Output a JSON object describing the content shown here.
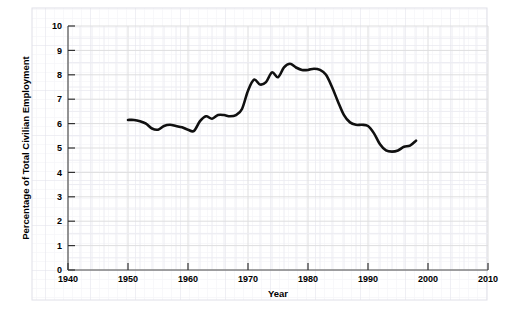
{
  "chart_data": {
    "type": "line",
    "title": "",
    "xlabel": "Year",
    "ylabel": "Percentage of Total Civilian Employment",
    "xlim": [
      1940,
      2010
    ],
    "ylim": [
      0,
      10
    ],
    "xticks": [
      1940,
      1950,
      1960,
      1970,
      1980,
      1990,
      2000,
      2010
    ],
    "xticklabels": [
      "1940",
      "1950",
      "1960",
      "1970",
      "1980",
      "1990",
      "2000",
      "2010"
    ],
    "yticks": [
      0,
      1,
      2,
      3,
      4,
      5,
      6,
      7,
      8,
      9,
      10
    ],
    "yticklabels": [
      "0",
      "1",
      "2",
      "3",
      "4",
      "5",
      "6",
      "7",
      "8",
      "9",
      "10"
    ],
    "grid": true,
    "grid_color": "#e8e8ee",
    "line_color": "#101010",
    "line_width": 2.6,
    "legend": null,
    "series": [
      {
        "name": "Percentage of Total Civilian Employment",
        "x": [
          1950,
          1951,
          1952,
          1953,
          1954,
          1955,
          1956,
          1957,
          1958,
          1959,
          1960,
          1961,
          1962,
          1963,
          1964,
          1965,
          1966,
          1967,
          1968,
          1969,
          1970,
          1971,
          1972,
          1973,
          1974,
          1975,
          1976,
          1977,
          1978,
          1979,
          1980,
          1981,
          1982,
          1983,
          1984,
          1985,
          1986,
          1987,
          1988,
          1989,
          1990,
          1991,
          1992,
          1993,
          1994,
          1995,
          1996,
          1997,
          1998
        ],
        "y": [
          6.15,
          6.15,
          6.1,
          6.0,
          5.8,
          5.75,
          5.9,
          5.95,
          5.9,
          5.85,
          5.75,
          5.7,
          6.1,
          6.3,
          6.2,
          6.35,
          6.35,
          6.3,
          6.35,
          6.6,
          7.35,
          7.8,
          7.6,
          7.7,
          8.1,
          7.9,
          8.3,
          8.45,
          8.3,
          8.2,
          8.2,
          8.25,
          8.2,
          8.0,
          7.5,
          6.9,
          6.35,
          6.05,
          5.95,
          5.95,
          5.9,
          5.6,
          5.15,
          4.9,
          4.85,
          4.9,
          5.05,
          5.1,
          5.3
        ]
      }
    ]
  },
  "axes": {
    "y_axis_title": "Percentage of Total Civilian Employment",
    "x_axis_title": "Year"
  }
}
